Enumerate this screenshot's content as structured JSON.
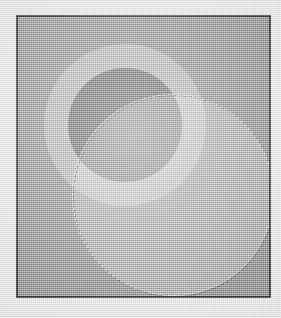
{
  "document": {
    "title": "Ellipse selection on gray canvas",
    "medium": "scanned raster graphic",
    "width_px": 281,
    "height_px": 318
  },
  "page": {
    "background_color": "#e9e9e9",
    "texture": "scan-grain"
  },
  "frame": {
    "label": "artwork-frame",
    "border_color": "#161616",
    "border_width_px": 2,
    "left_px": 16,
    "top_px": 15,
    "width_px": 255,
    "height_px": 283
  },
  "canvas": {
    "label": "canvas-surface",
    "background_color": "#878787"
  },
  "shapes": [
    {
      "name": "ring-outer-disc",
      "kind": "circle",
      "role": "annulus outer",
      "fill": "#b2b2b2",
      "center_x_px": 107,
      "center_y_px": 108,
      "radius_px": 81
    },
    {
      "name": "ring-inner-disc",
      "kind": "circle",
      "role": "annulus hole fill",
      "fill": "#4d4d4d",
      "center_x_px": 107,
      "center_y_px": 108,
      "radius_px": 57
    },
    {
      "name": "selection-circle",
      "kind": "circle",
      "role": "active elliptical selection",
      "fill": "rgba(255,255,255,0.30)",
      "outline": "marching-ants dashed",
      "outline_light_color": "#f2f2f2",
      "outline_dark_color": "#2e2e2e",
      "center_x_px": 155,
      "center_y_px": 178,
      "radius_px": 101
    }
  ],
  "observed_tones": {
    "outer_paper": "#e9e9e9",
    "frame_border": "#161616",
    "canvas_base": "#878787",
    "ring_band": "#b2b2b2",
    "ring_core_dark": "#4d4d4d",
    "selection_over_canvas": "#ababab",
    "selection_over_dark_core": "#bdbdbd",
    "selection_over_ring_band": "#d8d8d8"
  },
  "chart_data": {
    "type": "scatter",
    "xlabel": "x (px)",
    "ylabel": "y (px)",
    "xlim": [
      0,
      255
    ],
    "ylim": [
      0,
      283
    ],
    "series": [
      {
        "name": "annulus",
        "values": [
          {
            "cx": 107,
            "cy": 108,
            "r": 81,
            "tone": "#b2b2b2"
          },
          {
            "cx": 107,
            "cy": 108,
            "r": 57,
            "tone": "#4d4d4d"
          }
        ]
      },
      {
        "name": "selection",
        "values": [
          {
            "cx": 155,
            "cy": 178,
            "r": 101,
            "tone": "rgba(255,255,255,0.30)"
          }
        ]
      }
    ]
  }
}
